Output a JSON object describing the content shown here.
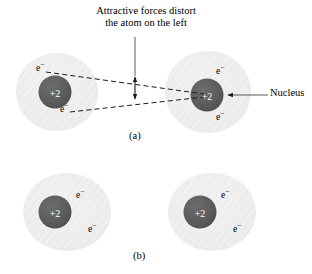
{
  "figure": {
    "title_annotation": "Attractive forces distort the atom on the left",
    "annotation_line1": "Attractive forces distort",
    "annotation_line2": "the atom on the left",
    "nucleus_callout": "Nucleus",
    "panel_a_label": "(a)",
    "panel_b_label": "(b)",
    "nucleus_charge": "+2",
    "electron_symbol": "e",
    "electron_superscript": "−",
    "colors": {
      "background": "#ffffff",
      "electron_cloud": "#eeeeee",
      "cloud_hatch": "#e2e2e2",
      "nucleus_fill": "#595959",
      "nucleus_text": "#ffffff",
      "line": "#1a1a1a",
      "text": "#000000"
    },
    "panels": [
      {
        "id": "a",
        "label": "(a)",
        "description": "Two atoms; the left atom's electron cloud is distorted by attractive forces toward the right atom's nucleus",
        "atoms": [
          {
            "id": "a-left",
            "position": "left",
            "distorted": true,
            "nucleus_charge": "+2",
            "electron_labels": [
              "e−",
              "e−"
            ]
          },
          {
            "id": "a-right",
            "position": "right",
            "distorted": false,
            "nucleus_charge": "+2",
            "electron_labels": [
              "e−",
              "e−"
            ]
          }
        ],
        "annotations": [
          {
            "name": "attractive-force-lines",
            "style": "dashed",
            "count": 2
          },
          {
            "name": "distortion-span-arrow",
            "style": "double-headed-vertical"
          },
          {
            "name": "nucleus-callout-arrow",
            "style": "single-headed-leader"
          }
        ]
      },
      {
        "id": "b",
        "label": "(b)",
        "description": "Two identical undistorted atoms shown separately",
        "atoms": [
          {
            "id": "b-left",
            "position": "left",
            "distorted": false,
            "nucleus_charge": "+2",
            "electron_labels": [
              "e−",
              "e−"
            ]
          },
          {
            "id": "b-right",
            "position": "right",
            "distorted": false,
            "nucleus_charge": "+2",
            "electron_labels": [
              "e−",
              "e−"
            ]
          }
        ],
        "annotations": []
      }
    ]
  }
}
